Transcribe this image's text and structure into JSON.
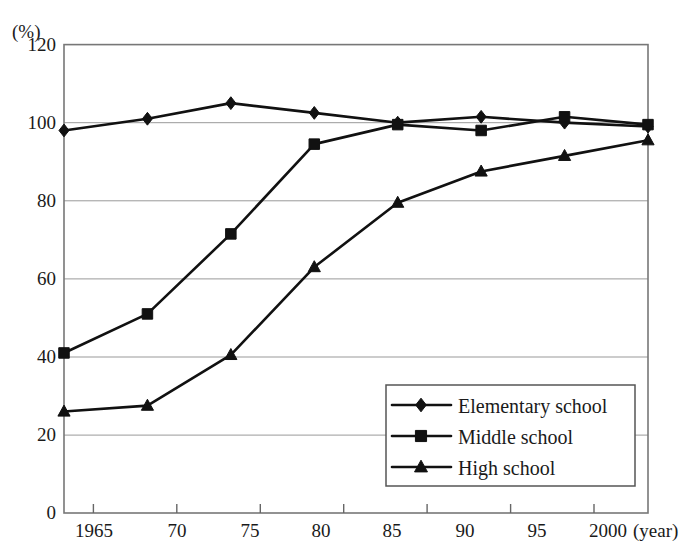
{
  "figure": {
    "y_axis_unit": "(%)",
    "x_axis_unit": "(year)",
    "cutoff_title_sliver": ""
  },
  "chart_data": {
    "type": "line",
    "title": "",
    "xlabel": "(year)",
    "ylabel": "(%)",
    "categories": [
      "1965",
      "70",
      "75",
      "80",
      "85",
      "90",
      "95",
      "2000"
    ],
    "x_values": [
      1965,
      1970,
      1975,
      1980,
      1985,
      1990,
      1995,
      2000
    ],
    "xlim": [
      1965,
      2000
    ],
    "ylim": [
      0,
      120
    ],
    "y_ticks": [
      0,
      20,
      40,
      60,
      80,
      100,
      120
    ],
    "x_tick_labels": [
      "1965",
      "70",
      "75",
      "80",
      "85",
      "90",
      "95",
      "2000"
    ],
    "grid": "horizontal",
    "legend_position": "lower-right-inside",
    "series": [
      {
        "name": "Elementary school",
        "marker": "diamond",
        "color": "#111111",
        "values": [
          98,
          101,
          105,
          102.5,
          100,
          101.5,
          100,
          99
        ]
      },
      {
        "name": "Middle school",
        "marker": "square",
        "color": "#111111",
        "values": [
          41,
          51,
          71.5,
          94.5,
          99.5,
          98,
          101.5,
          99.5
        ]
      },
      {
        "name": "High school",
        "marker": "triangle",
        "color": "#111111",
        "values": [
          26,
          27.5,
          40.5,
          63,
          79.5,
          87.5,
          91.5,
          95.5
        ]
      }
    ]
  },
  "legend": {
    "items": [
      {
        "label": "Elementary school",
        "marker": "diamond"
      },
      {
        "label": "Middle school",
        "marker": "square"
      },
      {
        "label": "High school",
        "marker": "triangle"
      }
    ]
  },
  "y_tick_labels": [
    "120",
    "100",
    "80",
    "60",
    "40",
    "20",
    "0"
  ]
}
